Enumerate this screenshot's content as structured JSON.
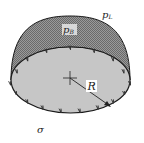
{
  "diagram": {
    "labels": {
      "outer_pressure": "p",
      "outer_pressure_sub": "L",
      "inner_pressure": "p",
      "inner_pressure_sub": "B",
      "radius": "R",
      "surface_tension": "σ"
    },
    "colors": {
      "dome_fill": "#8a8a8a",
      "disk_fill": "#c9c9c9",
      "stroke": "#1a1a1a",
      "arrow": "#444444",
      "background": "#ffffff"
    },
    "inner_arrow_count": 7,
    "outer_arrow_count": 10
  }
}
